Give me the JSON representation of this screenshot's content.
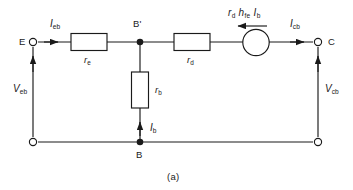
{
  "figure": {
    "caption": "(a)",
    "stroke_color": "#1a1a1a",
    "background_color": "#ffffff"
  },
  "terminals": [
    {
      "name": "emitter-terminal",
      "label": "E",
      "x": 33,
      "y": 42
    },
    {
      "name": "collector-terminal",
      "label": "C",
      "x": 318,
      "y": 42
    }
  ],
  "nodes": [
    {
      "name": "node-b-prime",
      "label": "B'",
      "x": 140,
      "y": 42
    },
    {
      "name": "node-b",
      "label": "B",
      "x": 140,
      "y": 142
    }
  ],
  "resistors": [
    {
      "name": "resistor-re",
      "symbol": "r",
      "subscript": "e",
      "orientation": "horizontal"
    },
    {
      "name": "resistor-rd",
      "symbol": "r",
      "subscript": "d",
      "orientation": "horizontal"
    },
    {
      "name": "resistor-rb",
      "symbol": "r",
      "subscript": "b",
      "orientation": "vertical"
    }
  ],
  "source": {
    "name": "dependent-current-source",
    "type": "controlled-source",
    "label_parts": [
      {
        "symbol": "r",
        "subscript": "d"
      },
      {
        "symbol": "h",
        "subscript": "fe"
      },
      {
        "symbol": "I",
        "subscript": "b"
      }
    ],
    "label_plain": "r_d h_fe I_b",
    "arrow_direction": "left"
  },
  "currents": [
    {
      "name": "current-ieb",
      "symbol": "I",
      "subscript": "eb",
      "direction": "right"
    },
    {
      "name": "current-icb",
      "symbol": "I",
      "subscript": "cb",
      "direction": "right"
    },
    {
      "name": "current-ib",
      "symbol": "I",
      "subscript": "b",
      "direction": "up"
    }
  ],
  "voltages": [
    {
      "name": "voltage-veb",
      "symbol": "V",
      "subscript": "eb",
      "direction": "up"
    },
    {
      "name": "voltage-vcb",
      "symbol": "V",
      "subscript": "cb",
      "direction": "up"
    }
  ]
}
